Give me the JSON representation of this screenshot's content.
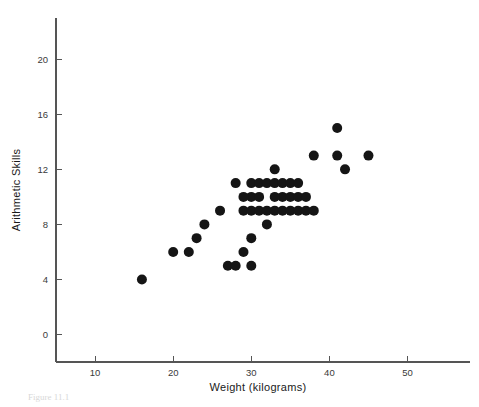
{
  "figure": {
    "caption": "Figure 11.1",
    "background_color": "#ffffff",
    "point_color": "#151515",
    "axis_color": "#555555"
  },
  "chart_data": {
    "type": "scatter",
    "title": "",
    "xlabel": "Weight (kilograms)",
    "ylabel": "Arithmetic Skills",
    "xlim": [
      5,
      58
    ],
    "ylim": [
      -2,
      23
    ],
    "xticks": [
      10,
      20,
      30,
      40,
      50
    ],
    "yticks": [
      0,
      4,
      8,
      12,
      16,
      20
    ],
    "xtick_labels": [
      "10",
      "20",
      "30",
      "40",
      "50"
    ],
    "ytick_labels": [
      "0",
      "4",
      "8",
      "12",
      "16",
      "20"
    ],
    "grid": false,
    "legend": "none",
    "marker": "filled-circle",
    "marker_size": 5,
    "n_points": 44,
    "points": [
      [
        16,
        4
      ],
      [
        20,
        6
      ],
      [
        22,
        6
      ],
      [
        23,
        7
      ],
      [
        24,
        8
      ],
      [
        26,
        9
      ],
      [
        27,
        5
      ],
      [
        28,
        5
      ],
      [
        28,
        11
      ],
      [
        29,
        9
      ],
      [
        29,
        6
      ],
      [
        30,
        7
      ],
      [
        30,
        10
      ],
      [
        30,
        11
      ],
      [
        30,
        9
      ],
      [
        31,
        11
      ],
      [
        31,
        9
      ],
      [
        32,
        11
      ],
      [
        32,
        9
      ],
      [
        32,
        8
      ],
      [
        33,
        11
      ],
      [
        33,
        9
      ],
      [
        33,
        12
      ],
      [
        34,
        11
      ],
      [
        34,
        9
      ],
      [
        34,
        10
      ],
      [
        35,
        9
      ],
      [
        35,
        10
      ],
      [
        36,
        9
      ],
      [
        36,
        10
      ],
      [
        37,
        9
      ],
      [
        38,
        9
      ],
      [
        38,
        13
      ],
      [
        41,
        15
      ],
      [
        41,
        13
      ],
      [
        42,
        12
      ],
      [
        45,
        13
      ],
      [
        30,
        5
      ],
      [
        29,
        10
      ],
      [
        31,
        10
      ],
      [
        35,
        11
      ],
      [
        36,
        11
      ],
      [
        33,
        10
      ],
      [
        37,
        10
      ]
    ]
  }
}
